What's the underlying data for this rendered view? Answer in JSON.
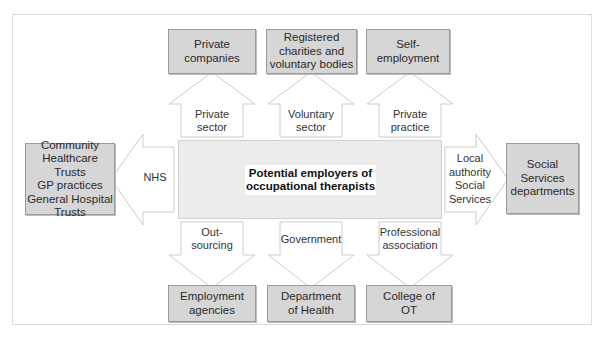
{
  "diagram": {
    "center": {
      "label_line1": "Potential employers of",
      "label_line2": "occupational therapists"
    },
    "top": [
      {
        "arrow_label_1": "Private",
        "arrow_label_2": "sector",
        "box_line1": "Private",
        "box_line2": "companies"
      },
      {
        "arrow_label_1": "Voluntary",
        "arrow_label_2": "sector",
        "box_line1": "Registered",
        "box_line2": "charities and",
        "box_line3": "voluntary bodies"
      },
      {
        "arrow_label_1": "Private",
        "arrow_label_2": "practice",
        "box_line1": "Self-",
        "box_line2": "employment"
      }
    ],
    "left": {
      "arrow_label": "NHS",
      "box_lines": [
        "Community",
        "Healthcare Trusts",
        "GP practices",
        "General Hospital",
        "Trusts"
      ]
    },
    "right": {
      "arrow_lines": [
        "Local",
        "authority",
        "Social",
        "Services"
      ],
      "box_lines": [
        "Social",
        "Services",
        "departments"
      ]
    },
    "bottom": [
      {
        "arrow_label_1": "Out-",
        "arrow_label_2": "sourcing",
        "box_line1": "Employment",
        "box_line2": "agencies"
      },
      {
        "arrow_label_1": "Government",
        "box_line1": "Department",
        "box_line2": "of Health"
      },
      {
        "arrow_label_1": "Professional",
        "arrow_label_2": "association",
        "box_line1": "College of",
        "box_line2": "OT"
      }
    ],
    "colors": {
      "box_fill": "#d6d6d6",
      "center_fill": "#ececec",
      "arrow_fill": "#ffffff",
      "arrow_stroke": "#cfcfcf",
      "frame": "#dcdcdc"
    }
  }
}
